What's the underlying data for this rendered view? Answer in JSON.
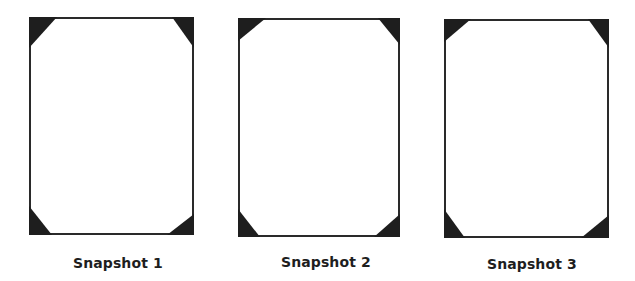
{
  "colors": {
    "frame_border": "#2a2a2a",
    "corner_fill": "#1e1e1e",
    "background": "#ffffff",
    "label_text": "#1e1e1e"
  },
  "snapshots": [
    {
      "label": "Snapshot 1",
      "frame": {
        "left": 29,
        "top": 17,
        "width": 165,
        "height": 218
      },
      "corners": {
        "top_left": {
          "w": 28,
          "h": 31
        },
        "top_right": {
          "w": 22,
          "h": 31
        },
        "bottom_left": {
          "w": 23,
          "h": 29
        },
        "bottom_right": {
          "w": 27,
          "h": 21
        }
      },
      "label_pos": {
        "left": 73,
        "top": 255
      }
    },
    {
      "label": "Snapshot 2",
      "frame": {
        "left": 238,
        "top": 18,
        "width": 162,
        "height": 219
      },
      "corners": {
        "top_left": {
          "w": 28,
          "h": 23
        },
        "top_right": {
          "w": 22,
          "h": 27
        },
        "bottom_left": {
          "w": 22,
          "h": 28
        },
        "bottom_right": {
          "w": 26,
          "h": 23
        }
      },
      "label_pos": {
        "left": 281,
        "top": 254
      }
    },
    {
      "label": "Snapshot 3",
      "frame": {
        "left": 444,
        "top": 19,
        "width": 165,
        "height": 219
      },
      "corners": {
        "top_left": {
          "w": 27,
          "h": 23
        },
        "top_right": {
          "w": 21,
          "h": 29
        },
        "bottom_left": {
          "w": 21,
          "h": 29
        },
        "bottom_right": {
          "w": 28,
          "h": 23
        }
      },
      "label_pos": {
        "left": 487,
        "top": 256
      }
    }
  ]
}
